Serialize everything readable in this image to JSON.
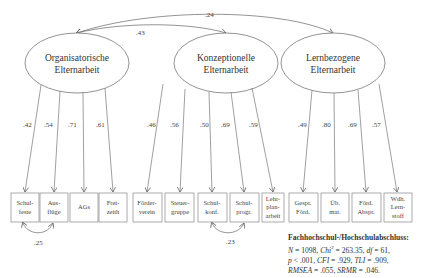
{
  "latent_factors": [
    {
      "id": "org",
      "lines": [
        "Organisatorische",
        "Elternarbeit"
      ],
      "cx": 77,
      "cy": 63,
      "rx": 52,
      "ry": 30
    },
    {
      "id": "konz",
      "lines": [
        "Konzeptionelle",
        "Elternarbeit"
      ],
      "cx": 226,
      "cy": 63,
      "rx": 52,
      "ry": 30
    },
    {
      "id": "lern",
      "lines": [
        "Lernbezogene",
        "Elternarbeit"
      ],
      "cx": 333,
      "cy": 63,
      "rx": 52,
      "ry": 30
    }
  ],
  "factor_correlations": [
    {
      "from": "org",
      "to": "konz",
      "value": ".43"
    },
    {
      "from": "org",
      "to": "lern",
      "value": ".24"
    }
  ],
  "indicators": [
    {
      "factor": "org",
      "lines": [
        "Schul-",
        "feste"
      ],
      "x": 11,
      "w": 28,
      "loading": ".42"
    },
    {
      "factor": "org",
      "lines": [
        "Aus-",
        "flüge"
      ],
      "x": 40,
      "w": 28,
      "loading": ".54"
    },
    {
      "factor": "org",
      "lines": [
        "AGs"
      ],
      "x": 70,
      "w": 28,
      "loading": ".71"
    },
    {
      "factor": "org",
      "lines": [
        "Frei-",
        "zeith"
      ],
      "x": 99,
      "w": 28,
      "loading": ".61"
    },
    {
      "factor": "konz",
      "lines": [
        "Förder-",
        "verein"
      ],
      "x": 133,
      "w": 29,
      "loading": ".46"
    },
    {
      "factor": "konz",
      "lines": [
        "Steuer-",
        "gruppe"
      ],
      "x": 165,
      "w": 29,
      "loading": ".56"
    },
    {
      "factor": "konz",
      "lines": [
        "Schul-",
        "konf."
      ],
      "x": 198,
      "w": 29,
      "loading": ".50"
    },
    {
      "factor": "konz",
      "lines": [
        "Schul-",
        "progr."
      ],
      "x": 230,
      "w": 29,
      "loading": ".69"
    },
    {
      "factor": "konz",
      "lines": [
        "Lehr-",
        "plan-",
        "arbeit"
      ],
      "x": 262,
      "w": 22,
      "loading": ".59"
    },
    {
      "factor": "lern",
      "lines": [
        "Gespr.",
        "Förd."
      ],
      "x": 289,
      "w": 29,
      "loading": ".49"
    },
    {
      "factor": "lern",
      "lines": [
        "Üb.",
        "mat."
      ],
      "x": 321,
      "w": 28,
      "loading": ".80"
    },
    {
      "factor": "lern",
      "lines": [
        "Förd.",
        "Abspr."
      ],
      "x": 352,
      "w": 29,
      "loading": ".69"
    },
    {
      "factor": "lern",
      "lines": [
        "Wdh.",
        "Lern-",
        "stoff"
      ],
      "x": 384,
      "w": 28,
      "loading": ".57"
    }
  ],
  "residual_correlations": [
    {
      "between": [
        "Schulfeste",
        "Ausflüge"
      ],
      "value": ".25"
    },
    {
      "between": [
        "Schulkonf.",
        "Schulprogr."
      ],
      "value": ".23"
    }
  ],
  "fit": {
    "title": "Fachhochschul-/Hochschulabschluss:",
    "line1": "N = 1098, Chi² = 263.35, df = 61,",
    "line2": "p < .001, CFI = .929, TLI = .909,",
    "line3": "RMSEA = .055, SRMR = .046.",
    "n_label": "N",
    "n_val": " = 1098, ",
    "chi_label": "Chi",
    "chi_sup": "2",
    "chi_val": " = 263.35, ",
    "df_label": "df",
    "df_val": " = 61,",
    "p_label": "p",
    "p_val": " < .001, ",
    "cfi_label": "CFI",
    "cfi_val": " = .929, ",
    "tli_label": "TLI",
    "tli_val": " = .909,",
    "rmsea_label": "RMSEA",
    "rmsea_val": " = .055, ",
    "srmr_label": "SRMR",
    "srmr_val": " = .046."
  },
  "colors": {
    "line": "#777777",
    "text": "#333333",
    "background": "#ffffff"
  }
}
